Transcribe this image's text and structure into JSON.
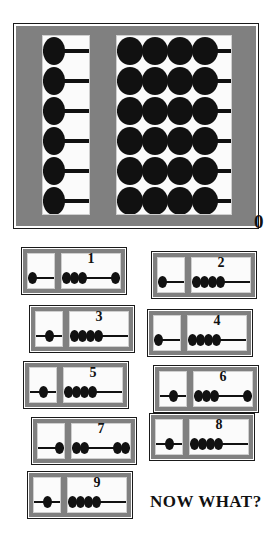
{
  "page": {
    "zero_label": "0",
    "footer_text": "NOW WHAT?",
    "bead_color": "#111111",
    "frame_color": "#808080",
    "panel_color": "#fbfbfb",
    "background_color": "#ffffff"
  },
  "main_abacus": {
    "name": "main-abacus",
    "left_column": {
      "rods": 6,
      "beads_per_rod": 1,
      "bead_position": "left"
    },
    "right_column": {
      "rods": 6,
      "beads_per_rod": 4,
      "bead_position": "left"
    }
  },
  "small_abacuses": [
    {
      "label": "1",
      "left_beads": 1,
      "left_align": "left",
      "right_group_left": 3,
      "right_group_right": 1,
      "x": 22,
      "y": 248
    },
    {
      "label": "2",
      "left_beads": 1,
      "left_align": "left",
      "right_group_left": 4,
      "right_group_right": 0,
      "x": 152,
      "y": 252
    },
    {
      "label": "3",
      "left_beads": 1,
      "left_align": "center",
      "right_group_left": 4,
      "right_group_right": 0,
      "x": 30,
      "y": 306
    },
    {
      "label": "4",
      "left_beads": 1,
      "left_align": "left",
      "right_group_left": 4,
      "right_group_right": 0,
      "x": 148,
      "y": 310
    },
    {
      "label": "5",
      "left_beads": 1,
      "left_align": "center",
      "right_group_left": 4,
      "right_group_right": 0,
      "x": 24,
      "y": 362
    },
    {
      "label": "6",
      "left_beads": 1,
      "left_align": "center",
      "right_group_left": 3,
      "right_group_right": 1,
      "x": 154,
      "y": 366
    },
    {
      "label": "7",
      "left_beads": 1,
      "left_align": "right",
      "right_group_left": 2,
      "right_group_right": 2,
      "x": 32,
      "y": 418
    },
    {
      "label": "8",
      "left_beads": 1,
      "left_align": "center",
      "right_group_left": 4,
      "right_group_right": 0,
      "x": 150,
      "y": 414
    },
    {
      "label": "9",
      "left_beads": 1,
      "left_align": "center",
      "right_group_left": 4,
      "right_group_right": 0,
      "x": 28,
      "y": 472
    }
  ]
}
